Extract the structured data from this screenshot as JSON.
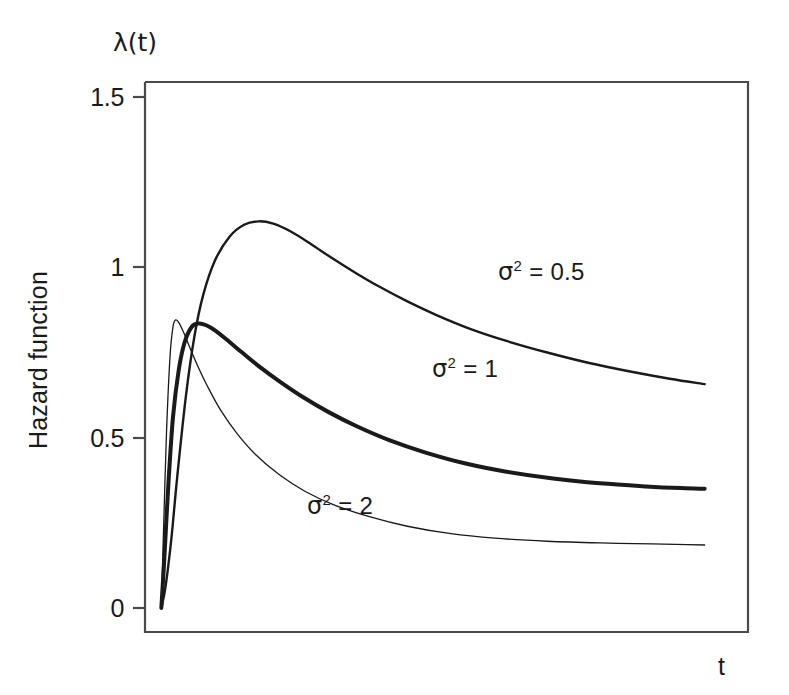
{
  "figure": {
    "background_color": "#ffffff",
    "line_color": "#1a1a1a",
    "axis_color": "#4a4a4a"
  },
  "axes": {
    "y_axis_title": "Hazard function",
    "y_axis_symbol": "λ(t)",
    "x_axis_symbol": "t",
    "y_ticks": [
      "0",
      "0.5",
      "1",
      "1.5"
    ],
    "x_ticks": []
  },
  "annotations": {
    "sigma_half": {
      "prefix": "σ",
      "exponent": "2",
      "equals": " = ",
      "value": "0.5"
    },
    "sigma_one": {
      "prefix": "σ",
      "exponent": "2",
      "equals": " = ",
      "value": "1"
    },
    "sigma_two": {
      "prefix": "σ",
      "exponent": "2",
      "equals": " = ",
      "value": "2"
    }
  },
  "chart_data": {
    "type": "line",
    "title": "",
    "xlabel": "t",
    "ylabel": "Hazard function",
    "y_axis_symbol": "λ(t)",
    "xlim": [
      0,
      10
    ],
    "ylim": [
      0,
      1.5
    ],
    "yticks": [
      0,
      0.5,
      1,
      1.5
    ],
    "ytick_labels": [
      "0",
      "0.5",
      "1",
      "1.5"
    ],
    "xticks": [],
    "grid": false,
    "legend_position": "inline-annotations",
    "series": [
      {
        "name": "σ² = 0.5",
        "label": "σ² = 0.5",
        "linewidth": 2.4,
        "color": "#1a1a1a",
        "peak": {
          "x": 1.95,
          "y": 1.135
        },
        "x": [
          0.28,
          0.35,
          0.45,
          0.55,
          0.7,
          0.85,
          1.0,
          1.2,
          1.45,
          1.7,
          1.95,
          2.2,
          2.5,
          2.85,
          3.2,
          3.6,
          4.0,
          4.5,
          5.0,
          5.6,
          6.2,
          6.9,
          7.6,
          8.3,
          9.0,
          9.6
        ],
        "y": [
          0.0,
          0.06,
          0.2,
          0.38,
          0.62,
          0.8,
          0.92,
          1.02,
          1.09,
          1.125,
          1.135,
          1.128,
          1.105,
          1.068,
          1.028,
          0.985,
          0.945,
          0.9,
          0.86,
          0.818,
          0.784,
          0.75,
          0.72,
          0.695,
          0.673,
          0.657
        ]
      },
      {
        "name": "σ² = 1",
        "label": "σ² = 1",
        "linewidth": 4.0,
        "color": "#1a1a1a",
        "peak": {
          "x": 0.92,
          "y": 0.835
        },
        "x": [
          0.28,
          0.33,
          0.4,
          0.48,
          0.58,
          0.68,
          0.8,
          0.92,
          1.05,
          1.2,
          1.4,
          1.65,
          1.95,
          2.3,
          2.7,
          3.15,
          3.65,
          4.2,
          4.8,
          5.5,
          6.2,
          7.0,
          7.8,
          8.6,
          9.2,
          9.6
        ],
        "y": [
          0.0,
          0.14,
          0.36,
          0.56,
          0.7,
          0.78,
          0.825,
          0.835,
          0.83,
          0.815,
          0.788,
          0.752,
          0.71,
          0.666,
          0.62,
          0.575,
          0.532,
          0.492,
          0.457,
          0.424,
          0.4,
          0.38,
          0.366,
          0.357,
          0.352,
          0.35
        ]
      },
      {
        "name": "σ² = 2",
        "label": "σ² = 2",
        "linewidth": 1.3,
        "color": "#1a1a1a",
        "peak": {
          "x": 0.52,
          "y": 0.845
        },
        "x": [
          0.28,
          0.32,
          0.37,
          0.43,
          0.48,
          0.52,
          0.58,
          0.66,
          0.76,
          0.9,
          1.08,
          1.3,
          1.58,
          1.9,
          2.3,
          2.75,
          3.25,
          3.85,
          4.5,
          5.25,
          6.0,
          6.9,
          7.8,
          8.7,
          9.3,
          9.6
        ],
        "y": [
          0.0,
          0.24,
          0.52,
          0.74,
          0.825,
          0.845,
          0.838,
          0.81,
          0.768,
          0.712,
          0.648,
          0.58,
          0.512,
          0.45,
          0.392,
          0.342,
          0.302,
          0.268,
          0.24,
          0.218,
          0.205,
          0.196,
          0.191,
          0.188,
          0.186,
          0.185
        ]
      }
    ]
  }
}
